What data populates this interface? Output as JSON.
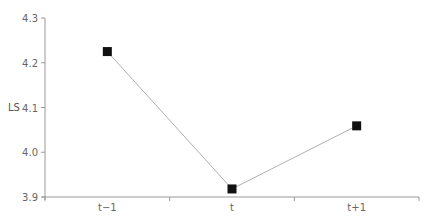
{
  "chart_data": {
    "type": "line",
    "title": "",
    "xlabel": "",
    "ylabel": "LS",
    "categories": [
      "t−1",
      "t",
      "t+1"
    ],
    "series": [
      {
        "name": "LS",
        "values": [
          4.225,
          3.918,
          4.059
        ],
        "marker": "square",
        "line_color": "#b0b0b0",
        "marker_color": "#111111"
      }
    ],
    "ylim": [
      3.9,
      4.3
    ],
    "yticks": [
      "3.9",
      "4.0",
      "4.1",
      "4.2",
      "4.3"
    ],
    "grid": false,
    "legend": "none"
  }
}
